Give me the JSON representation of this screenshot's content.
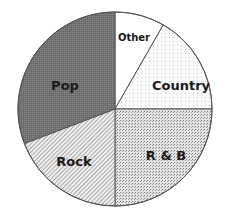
{
  "chart_data": {
    "type": "pie",
    "title": "",
    "start_angle_deg": 0,
    "direction": "clockwise",
    "slices": [
      {
        "label": "Other",
        "value": 8.3,
        "pattern": "white",
        "label_color": "#1a1a1a"
      },
      {
        "label": "Country",
        "value": 16.7,
        "pattern": "light-dots",
        "label_color": "#1a1a1a"
      },
      {
        "label": "R & B",
        "value": 25.0,
        "pattern": "dense-dots",
        "label_color": "#1a1a1a"
      },
      {
        "label": "Rock",
        "value": 19.2,
        "pattern": "diagonal",
        "label_color": "#1a1a1a"
      },
      {
        "label": "Pop",
        "value": 30.8,
        "pattern": "dark-dots",
        "label_color": "#e8e8e8"
      }
    ],
    "categories": [
      "Other",
      "Country",
      "R & B",
      "Rock",
      "Pop"
    ],
    "values": [
      8.3,
      16.7,
      25.0,
      19.2,
      30.8
    ],
    "legend": "none (labels inside slices)"
  }
}
